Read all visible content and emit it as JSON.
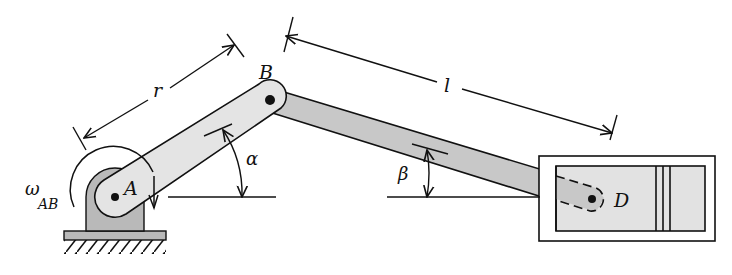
{
  "diagram": {
    "type": "slider-crank mechanism",
    "points": {
      "A": {
        "label": "A",
        "x": 115,
        "y": 197
      },
      "B": {
        "label": "B",
        "x": 270,
        "y": 100
      },
      "D": {
        "label": "D",
        "x": 592,
        "y": 199
      }
    },
    "labels": {
      "point_a": "A",
      "point_b": "B",
      "point_d": "D",
      "crank_length": "r",
      "rod_length": "l",
      "crank_angle": "α",
      "rod_angle": "β",
      "omega": "ω",
      "omega_sub": "AB"
    },
    "colors": {
      "line": "#111111",
      "crank_fill": "#e4e4e4",
      "rod_fill": "#c8c8c8",
      "support_fill": "#b9b9b9",
      "cylinder_fill": "#e2e2e2"
    }
  }
}
